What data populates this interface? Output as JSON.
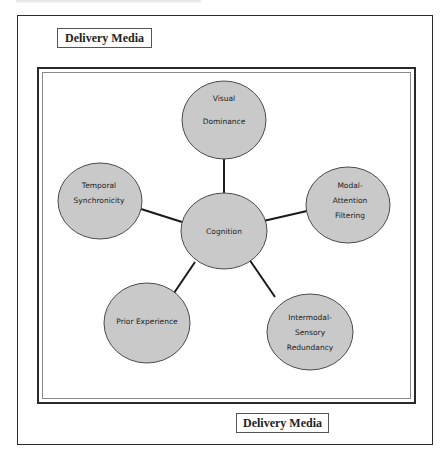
{
  "labels": {
    "top": "Delivery Media",
    "bottom": "Delivery Media"
  },
  "diagram": {
    "type": "radial",
    "center": {
      "id": "cognition",
      "lines": [
        "Cognition"
      ]
    },
    "nodes": [
      {
        "id": "visual-dominance",
        "lines": [
          "Visual",
          "Dominance"
        ]
      },
      {
        "id": "modal-attention-filtering",
        "lines": [
          "Modal-",
          "Attention",
          "Filtering"
        ]
      },
      {
        "id": "intermodal-sensory-redundancy",
        "lines": [
          "Intermodal-",
          "Sensory",
          "Redundancy"
        ]
      },
      {
        "id": "prior-experience",
        "lines": [
          "Prior Experience"
        ]
      },
      {
        "id": "temporal-synchronicity",
        "lines": [
          "Temporal",
          "Synchronicity"
        ]
      }
    ],
    "colors": {
      "node_fill": "#c9c9c9",
      "node_stroke": "#4a4a4a",
      "connector": "#1a1a1a"
    }
  }
}
